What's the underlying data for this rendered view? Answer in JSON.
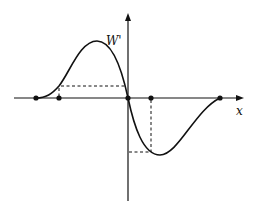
{
  "diagram": {
    "y_axis_label": "W'",
    "x_axis_label": "x",
    "colors": {
      "ink": "#111111",
      "background": "#ffffff"
    },
    "marked_points": [
      {
        "x": 36,
        "y": 98
      },
      {
        "x": 59,
        "y": 98
      },
      {
        "x": 128,
        "y": 98
      },
      {
        "x": 151,
        "y": 98
      },
      {
        "x": 220,
        "y": 98
      }
    ],
    "curve": "smooth S-shaped curve: zero at left point, rises to maximum left of origin, crosses origin, falls to minimum right of origin, returns to zero at right point",
    "dashed_guides": [
      {
        "from": [
          59,
          86
        ],
        "to": [
          128,
          86
        ]
      },
      {
        "from": [
          59,
          86
        ],
        "to": [
          59,
          98
        ]
      },
      {
        "from": [
          151,
          98
        ],
        "to": [
          151,
          152
        ]
      },
      {
        "from": [
          128,
          152
        ],
        "to": [
          151,
          152
        ]
      }
    ]
  }
}
